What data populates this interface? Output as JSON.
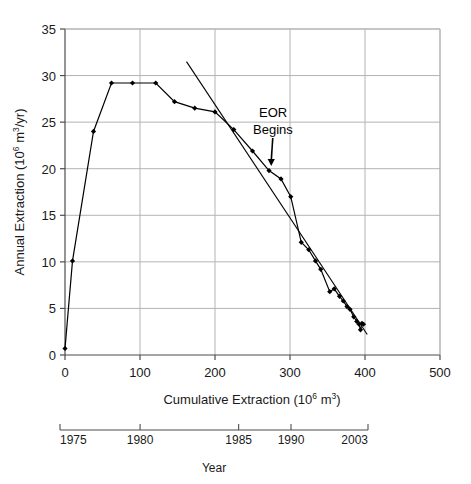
{
  "chart_data": {
    "type": "line",
    "title": "",
    "xlabel": "Cumulative Extraction (10⁶ m³)",
    "ylabel": "Annual Extraction (10⁶ m³/yr)",
    "xlim": [
      0,
      500
    ],
    "ylim": [
      0,
      35
    ],
    "xticks": [
      0,
      100,
      200,
      300,
      400,
      500
    ],
    "xticklabels": [
      "0",
      "100",
      "200",
      "300",
      "400",
      "500"
    ],
    "yticks": [
      0,
      5,
      10,
      15,
      20,
      25,
      30,
      35
    ],
    "yticklabels": [
      "0",
      "5",
      "10",
      "15",
      "20",
      "25",
      "30",
      "35"
    ],
    "grid": true,
    "legend": null,
    "series": [
      {
        "name": "Annual vs cumulative extraction",
        "marker": "filled-diamond",
        "points": [
          [
            0,
            0.7
          ],
          [
            10,
            10.1
          ],
          [
            38,
            24.0
          ],
          [
            62,
            29.2
          ],
          [
            90,
            29.2
          ],
          [
            121,
            29.2
          ],
          [
            146,
            27.2
          ],
          [
            173,
            26.5
          ],
          [
            200,
            26.1
          ],
          [
            225,
            24.2
          ],
          [
            250,
            21.9
          ],
          [
            272,
            19.8
          ],
          [
            288,
            18.9
          ],
          [
            301,
            17.0
          ],
          [
            315,
            12.1
          ],
          [
            325,
            11.3
          ],
          [
            334,
            10.1
          ],
          [
            341,
            9.2
          ],
          [
            353,
            6.8
          ],
          [
            359,
            7.1
          ],
          [
            366,
            6.3
          ],
          [
            371,
            5.8
          ],
          [
            376,
            5.2
          ],
          [
            380,
            4.9
          ],
          [
            385,
            4.1
          ],
          [
            389,
            3.6
          ],
          [
            392,
            3.3
          ],
          [
            394,
            2.7
          ],
          [
            396,
            3.4
          ],
          [
            398,
            3.3
          ]
        ]
      },
      {
        "name": "Decline trend line",
        "type": "straight-line",
        "p1": [
          162,
          31.5
        ],
        "p2": [
          403,
          2.2
        ]
      }
    ],
    "annotations": [
      {
        "name": "eor-begins",
        "text_line1": "EOR",
        "text_line2": "Begins",
        "arrow_from": [
          277,
          23.3
        ],
        "arrow_to": [
          275,
          20.3
        ]
      }
    ],
    "secondary_axis": {
      "name": "year-axis",
      "label": "Year",
      "ticks": [
        {
          "label": "1975",
          "x_cum": 0
        },
        {
          "label": "1980",
          "x_cum": 104
        },
        {
          "label": "1985",
          "x_cum": 232
        },
        {
          "label": "1990",
          "x_cum": 300
        },
        {
          "label": "2003",
          "x_cum": 400
        }
      ]
    }
  },
  "figure": {
    "background": "#ffffff",
    "grid_color": "#b3b3b3",
    "axis_color": "#4d4d4d",
    "line_color": "#000000",
    "marker_color": "#000000"
  }
}
